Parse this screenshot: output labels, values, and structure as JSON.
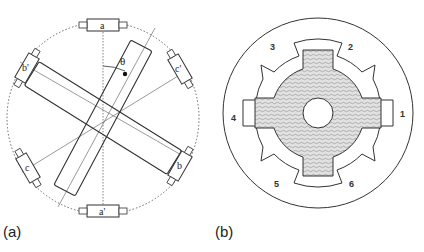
{
  "figure": {
    "panel_a": {
      "caption": "(a)",
      "coil_labels": {
        "top": "a",
        "bottom": "a'",
        "upper_right": "c'",
        "upper_left": "b'",
        "lower_left": "c",
        "lower_right": "b"
      },
      "angle_label": "θ"
    },
    "panel_b": {
      "caption": "(b)",
      "stator_pole_labels": [
        "1",
        "2",
        "3",
        "4",
        "5",
        "6"
      ]
    }
  },
  "colors": {
    "line": "#333333",
    "hatch_fill": "#d9d9d9",
    "background": "#ffffff"
  }
}
